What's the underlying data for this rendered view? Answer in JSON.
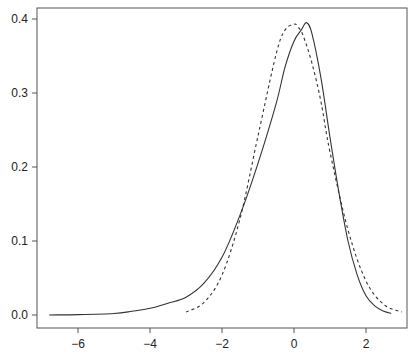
{
  "chart_data": {
    "type": "line",
    "title": "",
    "xlabel": "",
    "ylabel": "",
    "xlim": [
      -7.1,
      3.1
    ],
    "ylim": [
      -0.0175,
      0.418
    ],
    "grid": false,
    "legend": null,
    "x_ticks": [
      -6,
      -4,
      -2,
      0,
      2
    ],
    "x_tick_labels": [
      "−6",
      "−4",
      "−2",
      "0",
      "2"
    ],
    "y_ticks": [
      0.0,
      0.1,
      0.2,
      0.3,
      0.4
    ],
    "y_tick_labels": [
      "0.0",
      "0.1",
      "0.2",
      "0.3",
      "0.4"
    ],
    "series": [
      {
        "name": "empirical density",
        "style": "solid",
        "color": "#333333",
        "x": [
          -6.8,
          -6.0,
          -5.0,
          -4.5,
          -4.0,
          -3.5,
          -3.0,
          -2.5,
          -2.0,
          -1.5,
          -1.0,
          -0.5,
          -0.25,
          0.0,
          0.2,
          0.35,
          0.5,
          0.75,
          1.0,
          1.25,
          1.5,
          1.75,
          2.0,
          2.25,
          2.5,
          2.7
        ],
        "y": [
          0.0,
          0.0005,
          0.002,
          0.005,
          0.009,
          0.016,
          0.024,
          0.043,
          0.078,
          0.135,
          0.205,
          0.285,
          0.335,
          0.37,
          0.385,
          0.395,
          0.38,
          0.32,
          0.24,
          0.165,
          0.1,
          0.055,
          0.026,
          0.012,
          0.005,
          0.002
        ]
      },
      {
        "name": "normal density",
        "style": "dashed",
        "color": "#333333",
        "x": [
          -3.0,
          -2.5,
          -2.0,
          -1.5,
          -1.0,
          -0.5,
          -0.25,
          0.0,
          0.1,
          0.25,
          0.5,
          0.75,
          1.0,
          1.5,
          2.0,
          2.5,
          3.0
        ],
        "y": [
          0.004,
          0.017,
          0.054,
          0.13,
          0.242,
          0.352,
          0.385,
          0.393,
          0.39,
          0.378,
          0.34,
          0.288,
          0.22,
          0.115,
          0.046,
          0.014,
          0.004
        ]
      }
    ]
  }
}
